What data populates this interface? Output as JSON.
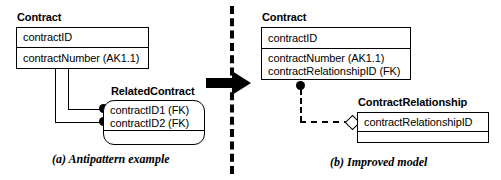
{
  "figure": {
    "left_panel": {
      "caption": "(a) Antipattern example",
      "entities": [
        {
          "name": "Contract",
          "key_attributes": [
            "contractID"
          ],
          "attributes": [
            "contractNumber (AK1.1)"
          ]
        },
        {
          "name": "RelatedContract",
          "key_attributes": [
            "contractID1 (FK)",
            "contractID2 (FK)"
          ],
          "attributes": []
        }
      ]
    },
    "right_panel": {
      "caption": "(b) Improved model",
      "entities": [
        {
          "name": "Contract",
          "key_attributes": [
            "contractID"
          ],
          "attributes": [
            "contractNumber (AK1.1)",
            "contractRelationshipID (FK)"
          ]
        },
        {
          "name": "ContractRelationship",
          "key_attributes": [
            "contractRelationshipID"
          ],
          "attributes": []
        }
      ]
    },
    "divider": {
      "style": "vertical-dashed-line"
    },
    "transform_arrow": {
      "icon": "right-arrow-icon",
      "direction": "right"
    },
    "colors": {
      "stroke": "#000000",
      "fill": "#ffffff"
    }
  }
}
